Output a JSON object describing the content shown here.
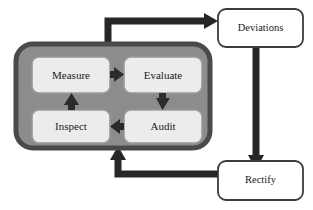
{
  "diagram": {
    "type": "flow-diagram",
    "colors": {
      "container_fill": "#8c8c8c",
      "container_stroke": "#4a4a4a",
      "inner_box_fill": "#ececec",
      "inner_box_stroke": "#8f8f8f",
      "outer_box_fill": "#ffffff",
      "outer_box_stroke": "#3c3c3c",
      "arrow_dark": "#262626",
      "arrow_inner": "#2b2b2b",
      "text": "#1a1a1a",
      "background": "#ffffff"
    },
    "container": {
      "name": "inner-loop-container"
    },
    "inner_nodes": [
      {
        "id": "measure",
        "label": "Measure"
      },
      {
        "id": "evaluate",
        "label": "Evaluate"
      },
      {
        "id": "inspect",
        "label": "Inspect"
      },
      {
        "id": "audit",
        "label": "Audit"
      }
    ],
    "outer_nodes": [
      {
        "id": "deviations",
        "label": "Deviations"
      },
      {
        "id": "rectify",
        "label": "Rectify"
      }
    ],
    "connectors": [
      {
        "id": "measure-to-evaluate",
        "from": "measure",
        "to": "evaluate",
        "direction": "right"
      },
      {
        "id": "evaluate-to-audit",
        "from": "evaluate",
        "to": "audit",
        "direction": "down"
      },
      {
        "id": "audit-to-inspect",
        "from": "audit",
        "to": "inspect",
        "direction": "left"
      },
      {
        "id": "inspect-to-measure",
        "from": "inspect",
        "to": "measure",
        "direction": "up"
      },
      {
        "id": "loop-to-deviations",
        "from": "inner-loop-container",
        "to": "deviations",
        "direction": "up-right"
      },
      {
        "id": "deviations-to-rectify",
        "from": "deviations",
        "to": "rectify",
        "direction": "down"
      },
      {
        "id": "rectify-to-loop",
        "from": "rectify",
        "to": "inner-loop-container",
        "direction": "left-up"
      }
    ]
  }
}
